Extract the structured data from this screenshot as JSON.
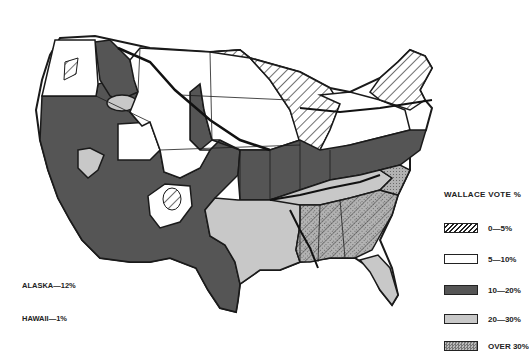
{
  "map": {
    "title": "Wallace vote by region",
    "regions": [
      {
        "id": "pacific-nw",
        "category": "5-10"
      },
      {
        "id": "mountain",
        "category": "10-20"
      },
      {
        "id": "plains-north",
        "category": "5-10"
      },
      {
        "id": "upper-midwest",
        "category": "0-5"
      },
      {
        "id": "great-lakes",
        "category": "5-10"
      },
      {
        "id": "midwest-south-band",
        "category": "10-20"
      },
      {
        "id": "texas-oklahoma",
        "category": "20-"
      },
      {
        "id": "deep-south",
        "category": "over"
      },
      {
        "id": "florida",
        "category": "20-"
      },
      {
        "id": "new-england",
        "category": "0-5"
      }
    ]
  },
  "legend": {
    "title": "WALLACE VOTE %",
    "items": [
      {
        "label": "0—5%",
        "pattern": "hatch",
        "color": "#ffffff"
      },
      {
        "label": "5—10%",
        "pattern": "solid",
        "color": "#ffffff"
      },
      {
        "label": "10—20%",
        "pattern": "solid",
        "color": "#555555"
      },
      {
        "label": "20—30%",
        "pattern": "solid",
        "color": "#c8c8c8"
      },
      {
        "label": "OVER 30%",
        "pattern": "dots",
        "color": "#a8a8a8"
      }
    ]
  },
  "notes": {
    "alaska": "ALASKA—12%",
    "hawaii": "HAWAII—1%"
  },
  "colors": {
    "dark": "#555555",
    "light": "#c8c8c8",
    "stipple": "#a9a9a9",
    "line": "#1a1a1a",
    "paper": "#ffffff"
  }
}
